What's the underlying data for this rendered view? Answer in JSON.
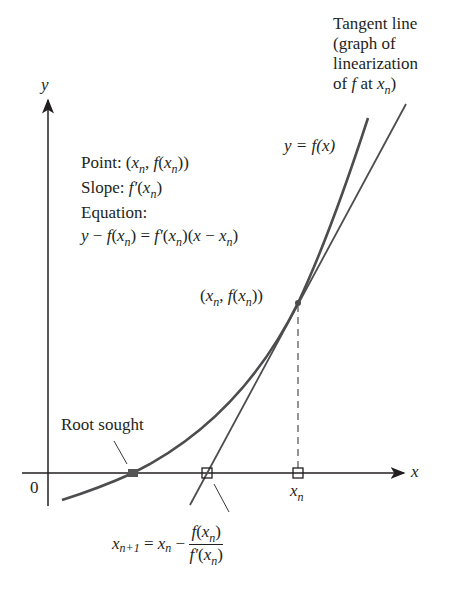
{
  "diagram": {
    "axes": {
      "x_label": "x",
      "y_label": "y",
      "origin_label": "0"
    },
    "labels": {
      "tangent_line": [
        "Tangent line",
        "(graph of",
        "linearization"
      ],
      "tangent_line_last": {
        "pre": "of ",
        "f": "f",
        "mid": " at ",
        "x": "x",
        "sub": "n",
        "post": ")"
      },
      "curve": "y = f(x)",
      "point_info": {
        "point_prefix": "Point: (",
        "slope_prefix": "Slope: ",
        "equation_heading": "Equation:",
        "equation": "y − f(x_n) = f′(x_n)(x − x_n)"
      },
      "point": "(x_n, f(x_n))",
      "root": "Root sought",
      "xn": "x_n",
      "update_formula": {
        "lhs": "x",
        "lhs_sub": "n+1",
        "eq": " = ",
        "x": "x",
        "x_sub": "n",
        "minus": " − ",
        "num": "f(x_n)",
        "den": "f′(x_n)"
      }
    },
    "colors": {
      "curve": "#4d4d4f",
      "text": "#231f20",
      "marker_fill": "#555555"
    }
  }
}
